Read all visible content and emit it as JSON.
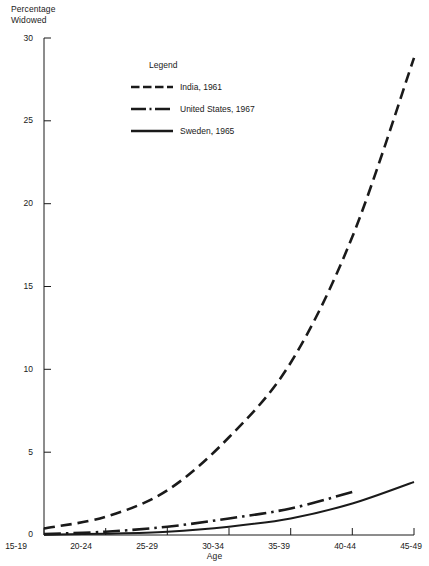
{
  "chart_data": {
    "type": "line",
    "title": "",
    "ylabel": "Percentage\nWidowed",
    "xlabel": "Age",
    "categories": [
      "15-19",
      "20-24",
      "25-29",
      "30-34",
      "35-39",
      "40-44",
      "45-49"
    ],
    "ylim": [
      0,
      30
    ],
    "yticks": [
      0,
      5,
      10,
      15,
      20,
      25,
      30
    ],
    "ytick_labels": [
      "0",
      "5",
      "10",
      "15",
      "20",
      "25",
      "30"
    ],
    "grid": false,
    "legend_position": "upper-center",
    "series": [
      {
        "name": "India, 1961",
        "style": "dashed",
        "values": [
          0.4,
          1.1,
          2.7,
          5.9,
          10.4,
          18.0,
          28.8
        ]
      },
      {
        "name": "United States, 1967",
        "style": "dash-dot",
        "values": [
          0.05,
          0.2,
          0.5,
          1.0,
          1.6,
          2.6,
          null
        ]
      },
      {
        "name": "Sweden, 1965",
        "style": "solid",
        "values": [
          0.02,
          0.08,
          0.2,
          0.5,
          1.0,
          1.9,
          3.2
        ]
      }
    ]
  },
  "legend": {
    "title": "Legend",
    "entries": [
      {
        "label": "India, 1961"
      },
      {
        "label": "United States, 1967"
      },
      {
        "label": "Sweden, 1965"
      }
    ]
  },
  "axes": {
    "y_title": "Percentage\nWidowed",
    "x_title": "Age",
    "y_tick_labels": [
      "30",
      "25",
      "20",
      "15",
      "10",
      "5",
      "0"
    ],
    "x_tick_labels": [
      "15-19",
      "20-24",
      "25-29",
      "30-34",
      "35-39",
      "40-44",
      "45-49"
    ]
  },
  "colors": {
    "ink": "#1a1a1a",
    "background": "#ffffff"
  }
}
